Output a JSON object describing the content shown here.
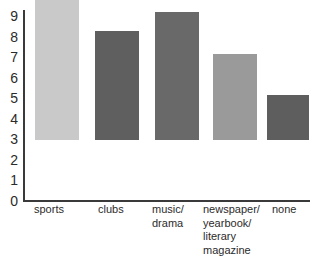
{
  "chart_data": {
    "type": "bar",
    "title": "",
    "subtitle": "",
    "xlabel": "",
    "ylabel": "",
    "grid": false,
    "legend": "none",
    "categories": [
      "sports",
      "clubs",
      "music/\ndrama",
      "newspaper/\nyearbook/\nliterary\nmagazine",
      "none"
    ],
    "values": [
      7.2,
      5.3,
      6.25,
      4.2,
      2.2
    ],
    "ylim": [
      0,
      9.3
    ],
    "yticks": [
      0,
      1,
      2,
      3,
      4,
      5,
      6,
      7,
      8,
      9
    ],
    "ytick_labels": [
      "0",
      "1",
      "2",
      "3",
      "4",
      "5",
      "6",
      "7",
      "8",
      "9"
    ],
    "bar_colors": [
      "#c9c9c9",
      "#5f5f5f",
      "#696969",
      "#9a9a9a",
      "#5e5e5e"
    ],
    "axis_color": "#3a3a3a",
    "text_color": "#2b2b2b",
    "background_color": "#ffffff"
  }
}
